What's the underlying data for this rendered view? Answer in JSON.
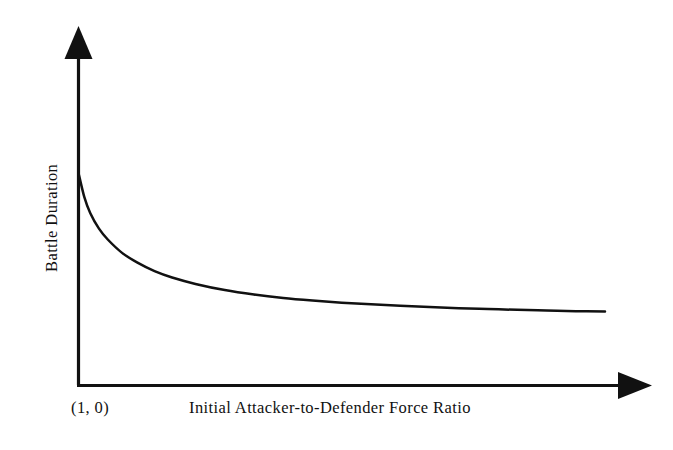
{
  "figure": {
    "background_color": "#ffffff",
    "ink_color": "#111111"
  },
  "chart_data": {
    "type": "line",
    "title": "",
    "subtitle": "",
    "xlabel": "Initial Attacker-to-Defender Force Ratio",
    "ylabel": "Battle Duration",
    "origin_label": "(1, 0)",
    "grid": false,
    "legend": null,
    "axis_style": {
      "x_axis_arrow": "right-arrowhead-icon",
      "y_axis_arrow": "up-arrowhead-icon",
      "ticks": "none",
      "tick_labels": "none",
      "spines": [
        "left",
        "bottom"
      ]
    },
    "xlim": [
      1,
      10
    ],
    "ylim": [
      0,
      1
    ],
    "x_tick_labels": [],
    "y_tick_labels": [],
    "annotations": [
      {
        "text": "(1, 0)",
        "position": "below-origin",
        "note": "origin coordinate label at start of x-axis"
      }
    ],
    "series": [
      {
        "name": "Battle Duration vs Force Ratio",
        "style": "solid",
        "color": "#111111",
        "description": "Monotonically decreasing hyperbolic decay curve, steep near the origin and asymptotically flattening to the right",
        "x": [
          1.0,
          1.1,
          1.2,
          1.35,
          1.5,
          1.75,
          2.0,
          2.3,
          2.6,
          3.0,
          3.5,
          4.0,
          4.5,
          5.0,
          5.5,
          6.0,
          6.5,
          7.0,
          7.5,
          8.0,
          8.5,
          9.0,
          9.5,
          10.0
        ],
        "y": [
          1.0,
          0.886,
          0.812,
          0.738,
          0.687,
          0.623,
          0.579,
          0.538,
          0.508,
          0.478,
          0.449,
          0.428,
          0.412,
          0.4,
          0.39,
          0.382,
          0.375,
          0.369,
          0.364,
          0.36,
          0.356,
          0.353,
          0.35,
          0.348
        ]
      }
    ]
  }
}
